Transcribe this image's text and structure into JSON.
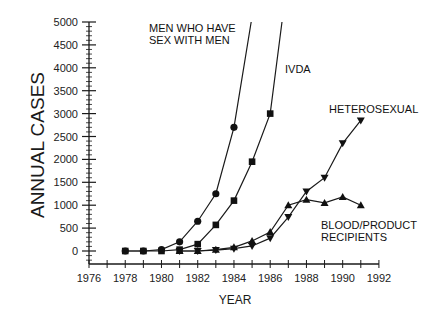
{
  "chart_data": {
    "type": "line",
    "title": "",
    "xlabel": "YEAR",
    "ylabel": "ANNUAL CASES",
    "xlim": [
      1976,
      1992
    ],
    "ylim": [
      -300,
      5000
    ],
    "x_ticks": [
      1976,
      1978,
      1980,
      1982,
      1984,
      1986,
      1988,
      1990,
      1992
    ],
    "y_ticks": [
      0,
      500,
      1000,
      1500,
      2000,
      2500,
      3000,
      3500,
      4000,
      4500,
      5000
    ],
    "grid": false,
    "legend": "inline labels",
    "series": [
      {
        "name": "MEN WHO HAVE SEX WITH MEN",
        "label_lines": [
          "MEN WHO HAVE",
          "SEX WITH MEN"
        ],
        "marker": "circle",
        "x": [
          1978,
          1979,
          1980,
          1981,
          1982,
          1983,
          1984
        ],
        "values": [
          0,
          0,
          30,
          200,
          650,
          1250,
          2700
        ],
        "continues_to": [
          1984.95,
          5000
        ]
      },
      {
        "name": "IVDA",
        "label_lines": [
          "IVDA"
        ],
        "marker": "square",
        "x": [
          1978,
          1979,
          1980,
          1981,
          1982,
          1983,
          1984,
          1985,
          1986
        ],
        "values": [
          0,
          0,
          0,
          30,
          150,
          570,
          1100,
          1950,
          3000
        ],
        "continues_to": [
          1986.65,
          5000
        ]
      },
      {
        "name": "HETEROSEXUAL",
        "label_lines": [
          "HETEROSEXUAL"
        ],
        "marker": "triangle-down",
        "x": [
          1981,
          1982,
          1983,
          1984,
          1985,
          1986,
          1987,
          1988,
          1989,
          1990,
          1991
        ],
        "values": [
          0,
          0,
          20,
          50,
          110,
          280,
          740,
          1300,
          1600,
          2350,
          2850
        ]
      },
      {
        "name": "BLOOD/PRODUCT RECIPIENTS",
        "label_lines": [
          "BLOOD/PRODUCT",
          "RECIPIENTS"
        ],
        "marker": "triangle-up",
        "x": [
          1981,
          1982,
          1983,
          1984,
          1985,
          1986,
          1987,
          1988,
          1989,
          1990,
          1991
        ],
        "values": [
          0,
          0,
          30,
          80,
          220,
          415,
          1000,
          1120,
          1050,
          1180,
          1000
        ]
      }
    ]
  },
  "colors": {
    "line": "#1a1a1a",
    "marker": "#111111",
    "background": "#ffffff"
  }
}
